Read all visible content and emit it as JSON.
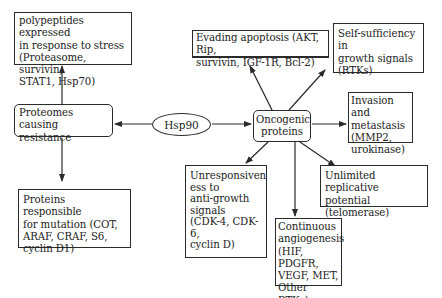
{
  "diagram": {
    "center": {
      "label": "Hsp90"
    },
    "left_hub": {
      "label": "Proteomes causing\n resistance"
    },
    "right_hub": {
      "label": "Oncogenic\nproteins"
    },
    "left_branches": [
      {
        "id": "stress",
        "label": "polypeptides expressed\n in response to stress\n(Proteasome, survivin,\nSTAT1, Hsp70)"
      },
      {
        "id": "mutation",
        "label": "Proteins responsible\nfor mutation (COT,\nARAF,  CRAF, S6,\ncyclin D1)"
      }
    ],
    "right_branches": [
      {
        "id": "apoptosis",
        "label": "Evading apoptosis (AKT, Rip,\nsurvivin,  IGF-1R, Bcl-2)"
      },
      {
        "id": "self_sufficiency",
        "label": "Self-sufficiency in\ngrowth signals\n(RTKs)"
      },
      {
        "id": "invasion",
        "label": "Invasion and\nmetastasis\n(MMP2,\nurokinase)"
      },
      {
        "id": "replicative",
        "label": "Unlimited replicative\npotential\n (telomerase)"
      },
      {
        "id": "angiogenesis",
        "label": "Continuous\n angiogenesis\n(HIF, PDGFR,\nVEGF, MET,\n Other RTKs)"
      },
      {
        "id": "anti_growth",
        "label": "Unresponsiven\ness to\n anti-growth\nsignals\n(CDK-4, CDK-\n6,\n cyclin D)"
      }
    ],
    "colors": {
      "line": "#2a2a2a",
      "background": "#ffffff"
    }
  }
}
